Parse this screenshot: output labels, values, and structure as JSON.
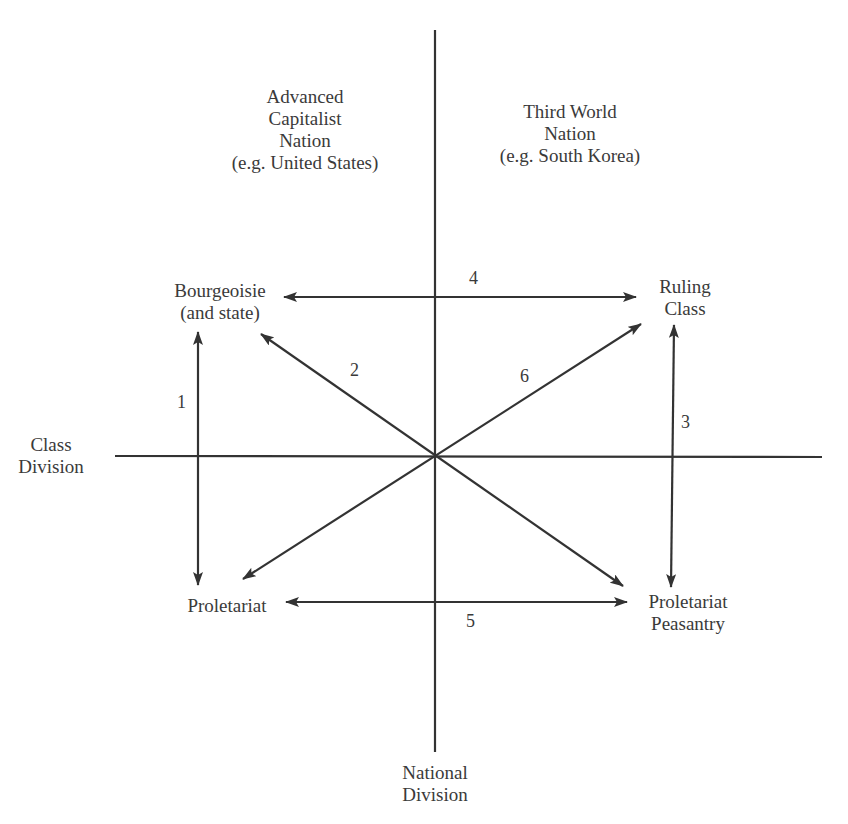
{
  "diagram": {
    "type": "relationship-diagram",
    "colors": {
      "line": "#333333",
      "text": "#3a3a3a",
      "background": "#ffffff"
    },
    "axes": {
      "horizontal": {
        "label_lines": [
          "Class",
          "Division"
        ]
      },
      "vertical": {
        "label_lines": [
          "National",
          "Division"
        ]
      }
    },
    "quadrant_headers": {
      "left": {
        "lines": [
          "Advanced",
          "Capitalist",
          "Nation",
          "(e.g. United States)"
        ]
      },
      "right": {
        "lines": [
          "Third World",
          "Nation",
          "(e.g. South Korea)"
        ]
      }
    },
    "nodes": {
      "bourgeoisie": {
        "lines": [
          "Bourgeoisie",
          "(and state)"
        ]
      },
      "ruling_class": {
        "lines": [
          "Ruling",
          "Class"
        ]
      },
      "proletariat": {
        "lines": [
          "Proletariat"
        ]
      },
      "proletariat_peasantry": {
        "lines": [
          "Proletariat",
          "Peasantry"
        ]
      }
    },
    "relations": [
      {
        "id": "1",
        "from": "Bourgeoisie (and state)",
        "to": "Proletariat",
        "bidirectional": true
      },
      {
        "id": "2",
        "from": "Proletariat Peasantry",
        "to": "Bourgeoisie (and state)",
        "bidirectional": true
      },
      {
        "id": "3",
        "from": "Ruling Class",
        "to": "Proletariat Peasantry",
        "bidirectional": true
      },
      {
        "id": "4",
        "from": "Bourgeoisie (and state)",
        "to": "Ruling Class",
        "bidirectional": true
      },
      {
        "id": "5",
        "from": "Proletariat",
        "to": "Proletariat Peasantry",
        "bidirectional": true
      },
      {
        "id": "6",
        "from": "Proletariat",
        "to": "Ruling Class",
        "bidirectional": true
      }
    ]
  }
}
